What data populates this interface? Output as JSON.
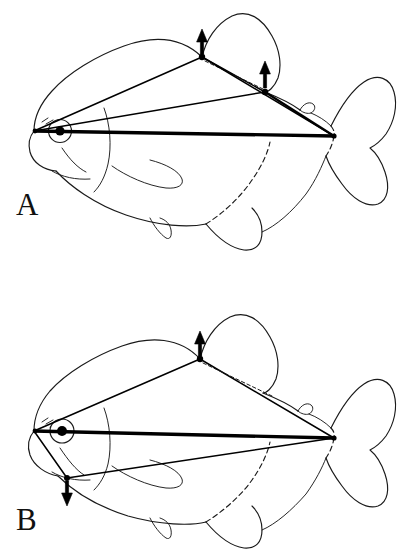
{
  "figure": {
    "background_color": "#ffffff",
    "ink_color": "#1a1a1a",
    "measurement_color": "#000000"
  },
  "panels": [
    {
      "id": "panel-a",
      "label": "A",
      "label_position": {
        "x": 16,
        "y": 215
      },
      "arrows": [
        {
          "name": "dorsal-fin-origin-arrow",
          "direction": "up",
          "tip": {
            "x": 202,
            "y": 30
          },
          "base": {
            "x": 202,
            "y": 52
          },
          "landmark": "dorsal-fin origin"
        },
        {
          "name": "dorsal-fin-insertion-arrow",
          "direction": "up",
          "tip": {
            "x": 265,
            "y": 62
          },
          "base": {
            "x": 265,
            "y": 86
          },
          "landmark": "dorsal-fin insertion"
        }
      ],
      "landmarks": [
        {
          "name": "snout-tip",
          "x": 34,
          "y": 131
        },
        {
          "name": "dorsal-fin-origin",
          "x": 202,
          "y": 57
        },
        {
          "name": "dorsal-fin-insertion",
          "x": 265,
          "y": 92
        },
        {
          "name": "caudal-peduncle",
          "x": 334,
          "y": 136
        }
      ],
      "measurement_lines": [
        {
          "name": "standard-length-line",
          "weight": "heavy",
          "from": "snout-tip",
          "to": "caudal-peduncle"
        },
        {
          "name": "predorsal-line",
          "weight": "normal",
          "from": "snout-tip",
          "to": "dorsal-fin-origin"
        },
        {
          "name": "snout-to-dorsal-insertion-line",
          "weight": "normal",
          "from": "snout-tip",
          "to": "dorsal-fin-insertion"
        },
        {
          "name": "dorsal-base-line",
          "weight": "normal",
          "from": "dorsal-fin-origin",
          "to": "dorsal-fin-insertion"
        },
        {
          "name": "dorsal-origin-to-peduncle-line",
          "weight": "normal",
          "from": "dorsal-fin-origin",
          "to": "caudal-peduncle"
        },
        {
          "name": "dorsal-insertion-to-peduncle-line",
          "weight": "mid",
          "from": "dorsal-fin-insertion",
          "to": "caudal-peduncle"
        }
      ]
    },
    {
      "id": "panel-b",
      "label": "B",
      "label_position": {
        "x": 16,
        "y": 530
      },
      "arrows": [
        {
          "name": "dorsal-fin-origin-arrow",
          "direction": "up",
          "tip": {
            "x": 200,
            "y": 332
          },
          "base": {
            "x": 200,
            "y": 354
          },
          "landmark": "dorsal-fin origin"
        },
        {
          "name": "ventral-isthmus-arrow",
          "direction": "down",
          "tip": {
            "x": 67,
            "y": 505
          },
          "base": {
            "x": 67,
            "y": 482
          },
          "landmark": "pelvic / isthmus landmark"
        }
      ],
      "landmarks": [
        {
          "name": "snout-tip",
          "x": 34,
          "y": 431
        },
        {
          "name": "dorsal-fin-origin",
          "x": 200,
          "y": 359
        },
        {
          "name": "ventral-isthmus-point",
          "x": 67,
          "y": 478
        },
        {
          "name": "caudal-peduncle",
          "x": 334,
          "y": 438
        }
      ],
      "measurement_lines": [
        {
          "name": "standard-length-line",
          "weight": "heavy",
          "from": "snout-tip",
          "to": "caudal-peduncle"
        },
        {
          "name": "predorsal-line",
          "weight": "normal",
          "from": "snout-tip",
          "to": "dorsal-fin-origin"
        },
        {
          "name": "dorsal-origin-to-peduncle-line",
          "weight": "normal",
          "from": "dorsal-fin-origin",
          "to": "caudal-peduncle"
        },
        {
          "name": "snout-to-ventral-line",
          "weight": "normal",
          "from": "snout-tip",
          "to": "ventral-isthmus-point"
        },
        {
          "name": "ventral-to-peduncle-line",
          "weight": "normal",
          "from": "ventral-isthmus-point",
          "to": "caudal-peduncle"
        }
      ]
    }
  ]
}
